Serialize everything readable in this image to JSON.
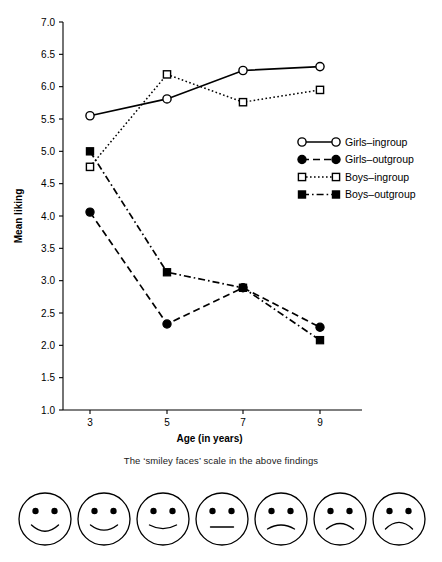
{
  "chart_data": {
    "type": "line",
    "title": "",
    "xlabel": "Age (in years)",
    "ylabel": "Mean liking",
    "x": [
      3,
      5,
      7,
      9
    ],
    "xticklabels": [
      "3",
      "5",
      "7",
      "9"
    ],
    "ylim": [
      1.0,
      7.0
    ],
    "yticks": [
      1.0,
      1.5,
      2.0,
      2.5,
      3.0,
      3.5,
      4.0,
      4.5,
      5.0,
      5.5,
      6.0,
      6.5,
      7.0
    ],
    "yticklabels": [
      "1.0",
      "1.5",
      "2.0",
      "2.5",
      "3.0",
      "3.5",
      "4.0",
      "4.5",
      "5.0",
      "5.5",
      "6.0",
      "6.5",
      "7.0"
    ],
    "grid": false,
    "legend_position": "center-right",
    "series": [
      {
        "name": "Girls–ingroup",
        "values": [
          5.55,
          5.81,
          6.25,
          6.31
        ],
        "line_style": "solid",
        "marker": "open-circle"
      },
      {
        "name": "Girls–outgroup",
        "values": [
          4.06,
          2.33,
          2.89,
          2.28
        ],
        "line_style": "dashed",
        "marker": "filled-circle"
      },
      {
        "name": "Boys–ingroup",
        "values": [
          4.76,
          6.19,
          5.76,
          5.95
        ],
        "line_style": "dotted",
        "marker": "open-square"
      },
      {
        "name": "Boys–outgroup",
        "values": [
          5.0,
          3.13,
          2.89,
          2.08
        ],
        "line_style": "dash-dot",
        "marker": "filled-square"
      }
    ]
  },
  "caption": "The ‘smiley faces’ scale in the above findings",
  "faces": [
    {
      "name": "face-very-happy",
      "expression": "happy",
      "curve": 7
    },
    {
      "name": "face-happy",
      "expression": "happy",
      "curve": 5.5
    },
    {
      "name": "face-slightly-happy",
      "expression": "happy",
      "curve": 3.5
    },
    {
      "name": "face-neutral",
      "expression": "neutral",
      "curve": 0
    },
    {
      "name": "face-slightly-sad",
      "expression": "sad",
      "curve": -4
    },
    {
      "name": "face-sad",
      "expression": "sad",
      "curve": -6
    },
    {
      "name": "face-very-sad",
      "expression": "sad",
      "curve": -7.5
    }
  ],
  "colors": {
    "line": "#000000",
    "text": "#000000",
    "background": "#ffffff"
  }
}
